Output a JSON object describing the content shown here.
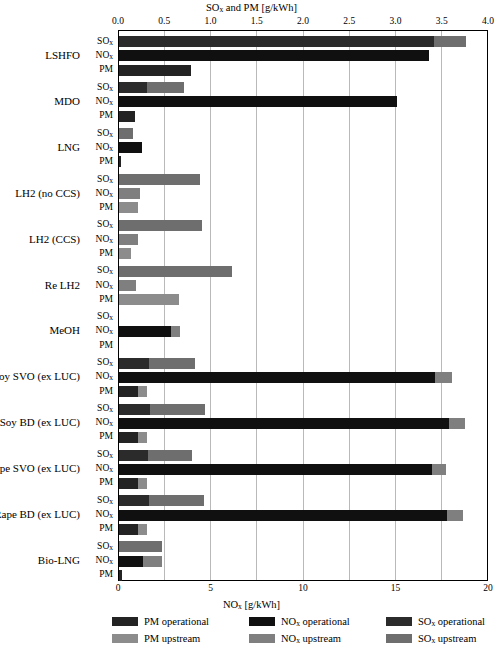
{
  "chart_data": {
    "type": "bar",
    "orientation": "horizontal",
    "title": "",
    "top_axis": {
      "label_html": "SOx and PM [g/kWh]",
      "label_base": "SO",
      "label_sub": "x",
      "label_rest": " and PM [g/kWh]",
      "min": 0.0,
      "max": 4.0,
      "ticks": [
        "0.0",
        "0.5",
        "1.0",
        "1.5",
        "2.0",
        "2.5",
        "3.0",
        "3.5",
        "4.0"
      ],
      "tick_values": [
        0.0,
        0.5,
        1.0,
        1.5,
        2.0,
        2.5,
        3.0,
        3.5,
        4.0
      ]
    },
    "bottom_axis": {
      "label_base": "NO",
      "label_sub": "x",
      "label_rest": " [g/kWh]",
      "min": 0,
      "max": 20,
      "ticks": [
        "0",
        "5",
        "10",
        "15",
        "20"
      ],
      "tick_values": [
        0,
        5,
        10,
        15,
        20
      ]
    },
    "grid": true,
    "series_order": [
      "SOx",
      "NOx",
      "PM"
    ],
    "series_labels": [
      {
        "base": "SO",
        "sub": "x"
      },
      {
        "base": "NO",
        "sub": "x"
      },
      {
        "base": "PM",
        "sub": ""
      }
    ],
    "colors": {
      "pm_operational": "#232323",
      "pm_upstream": "#8c8c8c",
      "nox_operational": "#101010",
      "nox_upstream": "#7f7f7f",
      "sox_operational": "#2b2b2b",
      "sox_upstream": "#6e6e6e",
      "gridline": "#b9b9b9",
      "axis": "#000000"
    },
    "categories": [
      "LSHFO",
      "MDO",
      "LNG",
      "LH2 (no CCS)",
      "LH2 (CCS)",
      "Re LH2",
      "MeOH",
      "Soy SVO (ex LUC)",
      "Soy BD (ex LUC)",
      "Rape SVO (ex LUC)",
      "Rape BD (ex LUC)",
      "Bio-LNG"
    ],
    "values": {
      "LSHFO": {
        "SOx": {
          "operational": 3.4,
          "upstream": 0.35,
          "axis": "top"
        },
        "NOx": {
          "operational": 16.75,
          "upstream": 0.0,
          "axis": "bottom"
        },
        "PM": {
          "operational": 0.78,
          "upstream": 0.0,
          "axis": "top"
        }
      },
      "MDO": {
        "SOx": {
          "operational": 0.3,
          "upstream": 0.4,
          "axis": "top"
        },
        "NOx": {
          "operational": 15.0,
          "upstream": 0.0,
          "axis": "bottom"
        },
        "PM": {
          "operational": 0.17,
          "upstream": 0.0,
          "axis": "top"
        }
      },
      "LNG": {
        "SOx": {
          "operational": 0.0,
          "upstream": 0.15,
          "axis": "top"
        },
        "NOx": {
          "operational": 1.25,
          "upstream": 0.0,
          "axis": "bottom"
        },
        "PM": {
          "operational": 0.02,
          "upstream": 0.0,
          "axis": "top"
        }
      },
      "LH2 (no CCS)": {
        "SOx": {
          "operational": 0.0,
          "upstream": 0.88,
          "axis": "top"
        },
        "NOx": {
          "operational": 0.0,
          "upstream": 1.12,
          "axis": "bottom"
        },
        "PM": {
          "operational": 0.0,
          "upstream": 0.2,
          "axis": "top"
        }
      },
      "LH2 (CCS)": {
        "SOx": {
          "operational": 0.0,
          "upstream": 0.9,
          "axis": "top"
        },
        "NOx": {
          "operational": 0.0,
          "upstream": 1.0,
          "axis": "bottom"
        },
        "PM": {
          "operational": 0.0,
          "upstream": 0.13,
          "axis": "top"
        }
      },
      "Re LH2": {
        "SOx": {
          "operational": 0.0,
          "upstream": 1.22,
          "axis": "top"
        },
        "NOx": {
          "operational": 0.0,
          "upstream": 0.9,
          "axis": "bottom"
        },
        "PM": {
          "operational": 0.0,
          "upstream": 0.65,
          "axis": "top"
        }
      },
      "MeOH": {
        "SOx": {
          "operational": 0.0,
          "upstream": 0.0,
          "axis": "top"
        },
        "NOx": {
          "operational": 2.8,
          "upstream": 0.5,
          "axis": "bottom"
        },
        "PM": {
          "operational": 0.0,
          "upstream": 0.0,
          "axis": "top"
        }
      },
      "Soy SVO (ex LUC)": {
        "SOx": {
          "operational": 0.32,
          "upstream": 0.5,
          "axis": "top"
        },
        "NOx": {
          "operational": 17.1,
          "upstream": 0.9,
          "axis": "bottom"
        },
        "PM": {
          "operational": 0.2,
          "upstream": 0.1,
          "axis": "top"
        }
      },
      "Soy BD (ex LUC)": {
        "SOx": {
          "operational": 0.34,
          "upstream": 0.59,
          "axis": "top"
        },
        "NOx": {
          "operational": 17.85,
          "upstream": 0.85,
          "axis": "bottom"
        },
        "PM": {
          "operational": 0.2,
          "upstream": 0.1,
          "axis": "top"
        }
      },
      "Rape SVO (ex LUC)": {
        "SOx": {
          "operational": 0.31,
          "upstream": 0.48,
          "axis": "top"
        },
        "NOx": {
          "operational": 16.9,
          "upstream": 0.8,
          "axis": "bottom"
        },
        "PM": {
          "operational": 0.2,
          "upstream": 0.1,
          "axis": "top"
        }
      },
      "Rape BD (ex LUC)": {
        "SOx": {
          "operational": 0.32,
          "upstream": 0.6,
          "axis": "top"
        },
        "NOx": {
          "operational": 17.75,
          "upstream": 0.85,
          "axis": "bottom"
        },
        "PM": {
          "operational": 0.2,
          "upstream": 0.1,
          "axis": "top"
        }
      },
      "Bio-LNG": {
        "SOx": {
          "operational": 0.0,
          "upstream": 0.47,
          "axis": "top"
        },
        "NOx": {
          "operational": 1.3,
          "upstream": 1.0,
          "axis": "bottom"
        },
        "PM": {
          "operational": 0.03,
          "upstream": 0.0,
          "axis": "top"
        }
      }
    }
  },
  "legend": {
    "position": "bottom",
    "items": [
      {
        "base": "PM",
        "sub": "",
        "rest": " operational",
        "color_key": "pm_operational",
        "col": 0,
        "row": 0
      },
      {
        "base": "PM",
        "sub": "",
        "rest": " upstream",
        "color_key": "pm_upstream",
        "col": 0,
        "row": 1
      },
      {
        "base": "NO",
        "sub": "x",
        "rest": " operational",
        "color_key": "nox_operational",
        "col": 1,
        "row": 0
      },
      {
        "base": "NO",
        "sub": "x",
        "rest": " upstream",
        "color_key": "nox_upstream",
        "col": 1,
        "row": 1
      },
      {
        "base": "SO",
        "sub": "x",
        "rest": " operational",
        "color_key": "sox_operational",
        "col": 2,
        "row": 0
      },
      {
        "base": "SO",
        "sub": "x",
        "rest": " upstream",
        "color_key": "sox_upstream",
        "col": 2,
        "row": 1
      }
    ]
  }
}
